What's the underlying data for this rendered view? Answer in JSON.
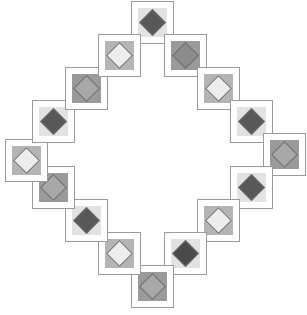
{
  "canvas": {
    "width": 307,
    "height": 315,
    "background": "#ffffff",
    "title": "Diamond Ring Pattern"
  },
  "style": {
    "cell_size": 43,
    "cell_border_color": "#9a9a9a",
    "cell_background": "#ffffff",
    "inner_size": 29,
    "diamond_size": 19,
    "diamond_border_color": "#6e6e6e"
  },
  "palette": {
    "light": "#ededed",
    "light_mid": "#dcdcdc",
    "mid": "#a8a8a8",
    "mid_dark": "#8c8c8c",
    "dark": "#585858",
    "very_dark": "#4a4a4a",
    "inner_light": "#e2e2e2",
    "inner_mid": "#b4b4b4",
    "inner_dark": "#9a9a9a"
  },
  "chart_data": {
    "type": "scatter",
    "xlabel": "",
    "ylabel": "",
    "grid": false,
    "legend": "none",
    "xlim": [
      0,
      307
    ],
    "ylim": [
      0,
      315
    ],
    "categories": [
      "n-1",
      "ne-1",
      "ne-2",
      "ne-3",
      "e-1",
      "se-1",
      "se-2",
      "se-3",
      "s-1",
      "sw-1",
      "sw-2",
      "sw-3",
      "w-1",
      "nw-1",
      "nw-2",
      "nw-3"
    ],
    "values": [
      {
        "index": 0,
        "clock": 12.0,
        "x": 153,
        "y": 22,
        "inner": "#e2e2e2",
        "diamond": "#585858",
        "shade": "dark"
      },
      {
        "index": 1,
        "clock": 1.0,
        "x": 196,
        "y": 34,
        "inner": "#9a9a9a",
        "diamond": "#8c8c8c",
        "shade": "mid-dark"
      },
      {
        "index": 2,
        "clock": 2.0,
        "x": 227,
        "y": 65,
        "inner": "#b4b4b4",
        "diamond": "#ededed",
        "shade": "light"
      },
      {
        "index": 3,
        "clock": 3.0,
        "x": 239,
        "y": 108,
        "inner": "#e2e2e2",
        "diamond": "#585858",
        "shade": "dark"
      },
      {
        "index": 4,
        "clock": 3.5,
        "x": 282,
        "y": 160,
        "inner": "#9a9a9a",
        "diamond": "#a8a8a8",
        "shade": "mid"
      },
      {
        "index": 5,
        "clock": 4.5,
        "x": 239,
        "y": 196,
        "inner": "#e2e2e2",
        "diamond": "#585858",
        "shade": "dark"
      },
      {
        "index": 6,
        "clock": 5.0,
        "x": 227,
        "y": 239,
        "inner": "#b4b4b4",
        "diamond": "#ededed",
        "shade": "light"
      },
      {
        "index": 7,
        "clock": 6.0,
        "x": 196,
        "y": 270,
        "inner": "#e2e2e2",
        "diamond": "#4a4a4a",
        "shade": "very-dark"
      },
      {
        "index": 8,
        "clock": 6.5,
        "x": 153,
        "y": 292,
        "inner": "#9a9a9a",
        "diamond": "#a8a8a8",
        "shade": "mid"
      },
      {
        "index": 9,
        "clock": 7.0,
        "x": 110,
        "y": 270,
        "inner": "#b4b4b4",
        "diamond": "#ededed",
        "shade": "light"
      },
      {
        "index": 10,
        "clock": 7.5,
        "x": 79,
        "y": 239,
        "inner": "#e2e2e2",
        "diamond": "#585858",
        "shade": "dark"
      },
      {
        "index": 11,
        "clock": 8.0,
        "x": 67,
        "y": 196,
        "inner": "#b4b4b4",
        "diamond": "#ededed",
        "shade": "light"
      },
      {
        "index": 12,
        "clock": 9.0,
        "x": 48,
        "y": 160,
        "inner": "#9a9a9a",
        "diamond": "#a8a8a8",
        "shade": "mid"
      },
      {
        "index": 13,
        "clock": 9.5,
        "x": 24,
        "y": 160,
        "inner": "#b4b4b4",
        "diamond": "#ededed",
        "shade": "light"
      },
      {
        "index": 14,
        "clock": 10.0,
        "x": 67,
        "y": 127,
        "inner": "#e2e2e2",
        "diamond": "#585858",
        "shade": "dark"
      },
      {
        "index": 15,
        "clock": 11.0,
        "x": 110,
        "y": 65,
        "inner": "#b4b4b4",
        "diamond": "#ededed",
        "shade": "light"
      }
    ]
  },
  "tiles": [
    {
      "name": "tile-top",
      "left": 131,
      "top": 1,
      "inner": "#e2e2e2",
      "diamond": "#585858"
    },
    {
      "name": "tile-top-right-1",
      "left": 164,
      "top": 34,
      "inner": "#9a9a9a",
      "diamond": "#8c8c8c"
    },
    {
      "name": "tile-top-right-2",
      "left": 197,
      "top": 67,
      "inner": "#b4b4b4",
      "diamond": "#ededed"
    },
    {
      "name": "tile-right-upper",
      "left": 230,
      "top": 100,
      "inner": "#e2e2e2",
      "diamond": "#585858"
    },
    {
      "name": "tile-right",
      "left": 263,
      "top": 133,
      "inner": "#9a9a9a",
      "diamond": "#a8a8a8"
    },
    {
      "name": "tile-right-lower",
      "left": 230,
      "top": 166,
      "inner": "#e2e2e2",
      "diamond": "#585858"
    },
    {
      "name": "tile-bottom-right-2",
      "left": 197,
      "top": 199,
      "inner": "#b4b4b4",
      "diamond": "#ededed"
    },
    {
      "name": "tile-bottom-right-1",
      "left": 164,
      "top": 232,
      "inner": "#e2e2e2",
      "diamond": "#4a4a4a"
    },
    {
      "name": "tile-bottom",
      "left": 131,
      "top": 265,
      "inner": "#9a9a9a",
      "diamond": "#a8a8a8"
    },
    {
      "name": "tile-bottom-left-1",
      "left": 98,
      "top": 232,
      "inner": "#b4b4b4",
      "diamond": "#ededed"
    },
    {
      "name": "tile-bottom-left-2",
      "left": 65,
      "top": 199,
      "inner": "#e2e2e2",
      "diamond": "#585858"
    },
    {
      "name": "tile-left-lower",
      "left": 32,
      "top": 166,
      "inner": "#9a9a9a",
      "diamond": "#a8a8a8"
    },
    {
      "name": "tile-left",
      "left": 5,
      "top": 139,
      "inner": "#b4b4b4",
      "diamond": "#ededed"
    },
    {
      "name": "tile-left-upper",
      "left": 32,
      "top": 100,
      "inner": "#e2e2e2",
      "diamond": "#585858"
    },
    {
      "name": "tile-top-left-2",
      "left": 65,
      "top": 67,
      "inner": "#9a9a9a",
      "diamond": "#a8a8a8"
    },
    {
      "name": "tile-top-left-1",
      "left": 98,
      "top": 34,
      "inner": "#b4b4b4",
      "diamond": "#ededed"
    }
  ]
}
